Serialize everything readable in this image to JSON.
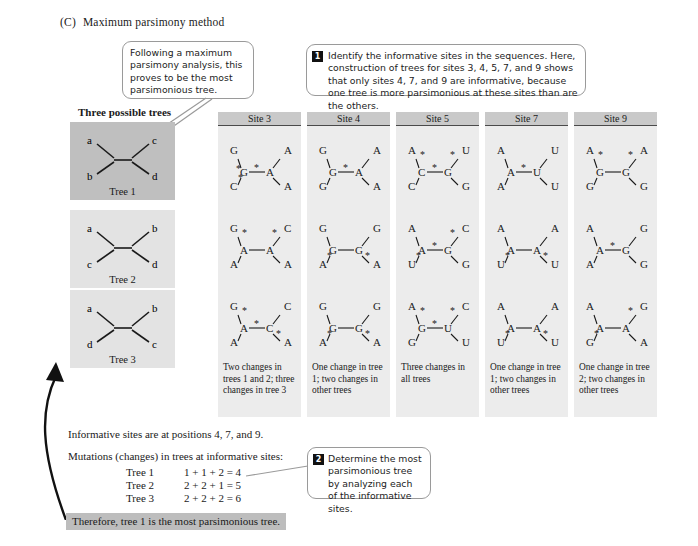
{
  "panel": {
    "label": "(C)",
    "title": "Maximum parsimony method"
  },
  "callouts": {
    "left": {
      "text": "Following a maximum parsimony analysis, this proves to be the most parsimonious tree."
    },
    "step1": {
      "number": "1",
      "text": "Identify the informative sites in the sequences. Here, construction of trees for sites 3, 4, 5, 7, and 9 shows that only sites 4, 7, and 9 are informative, because one tree is more parsimonious at these sites than are the others."
    },
    "step2": {
      "number": "2",
      "text": "Determine the most parsimonious tree by analyzing each of the informative sites."
    }
  },
  "trees_panel": {
    "heading": "Three possible trees",
    "trees": [
      {
        "label": "Tree 1",
        "tips": {
          "top_left": "a",
          "bottom_left": "b",
          "top_right": "c",
          "bottom_right": "d"
        },
        "highlighted": true
      },
      {
        "label": "Tree 2",
        "tips": {
          "top_left": "a",
          "bottom_left": "c",
          "top_right": "b",
          "bottom_right": "d"
        },
        "highlighted": false
      },
      {
        "label": "Tree 3",
        "tips": {
          "top_left": "a",
          "bottom_left": "d",
          "top_right": "b",
          "bottom_right": "c"
        },
        "highlighted": false
      }
    ]
  },
  "site_columns": [
    {
      "header": "Site 3",
      "caption": "Two changes in trees 1 and 2; three changes in tree 3",
      "trees": [
        {
          "top_left": "G",
          "bottom_left": "C",
          "top_right": "A",
          "bottom_right": "A",
          "internal_left": "G",
          "internal_right": "A",
          "asterisks": [
            "bottom-left",
            "internal-left",
            "middle"
          ]
        },
        {
          "top_left": "G",
          "bottom_left": "A",
          "top_right": "C",
          "bottom_right": "A",
          "internal_left": "A",
          "internal_right": "A",
          "asterisks": [
            "top-left",
            "top-right"
          ]
        },
        {
          "top_left": "G",
          "bottom_left": "A",
          "top_right": "C",
          "bottom_right": "A",
          "internal_left": "A",
          "internal_right": "C",
          "asterisks": [
            "top-left",
            "middle",
            "bottom-right"
          ]
        }
      ]
    },
    {
      "header": "Site 4",
      "caption": "One change in tree 1; two changes in other trees",
      "trees": [
        {
          "top_left": "G",
          "bottom_left": "G",
          "top_right": "A",
          "bottom_right": "A",
          "internal_left": "G",
          "internal_right": "A",
          "asterisks": [
            "middle"
          ]
        },
        {
          "top_left": "G",
          "bottom_left": "A",
          "top_right": "G",
          "bottom_right": "A",
          "internal_left": "G",
          "internal_right": "G",
          "asterisks": [
            "bottom-left",
            "bottom-right"
          ]
        },
        {
          "top_left": "G",
          "bottom_left": "A",
          "top_right": "G",
          "bottom_right": "A",
          "internal_left": "G",
          "internal_right": "G",
          "asterisks": [
            "bottom-left",
            "bottom-right"
          ]
        }
      ]
    },
    {
      "header": "Site 5",
      "caption": "Three changes in all trees",
      "trees": [
        {
          "top_left": "A",
          "bottom_left": "C",
          "top_right": "U",
          "bottom_right": "G",
          "internal_left": "C",
          "internal_right": "G",
          "asterisks": [
            "top-left",
            "middle",
            "top-right"
          ]
        },
        {
          "top_left": "A",
          "bottom_left": "U",
          "top_right": "C",
          "bottom_right": "G",
          "internal_left": "A",
          "internal_right": "G",
          "asterisks": [
            "bottom-left",
            "middle",
            "top-right"
          ]
        },
        {
          "top_left": "A",
          "bottom_left": "G",
          "top_right": "C",
          "bottom_right": "U",
          "internal_left": "G",
          "internal_right": "U",
          "asterisks": [
            "top-left",
            "middle",
            "top-right"
          ]
        }
      ]
    },
    {
      "header": "Site 7",
      "caption": "One change in tree 1; two changes in other trees",
      "trees": [
        {
          "top_left": "A",
          "bottom_left": "A",
          "top_right": "U",
          "bottom_right": "U",
          "internal_left": "A",
          "internal_right": "U",
          "asterisks": [
            "middle"
          ]
        },
        {
          "top_left": "A",
          "bottom_left": "U",
          "top_right": "A",
          "bottom_right": "U",
          "internal_left": "A",
          "internal_right": "A",
          "asterisks": [
            "bottom-left",
            "bottom-right"
          ]
        },
        {
          "top_left": "A",
          "bottom_left": "U",
          "top_right": "A",
          "bottom_right": "U",
          "internal_left": "A",
          "internal_right": "A",
          "asterisks": [
            "bottom-left",
            "bottom-right"
          ]
        }
      ]
    },
    {
      "header": "Site 9",
      "caption": "One change in tree 2; two changes in other trees",
      "trees": [
        {
          "top_left": "A",
          "bottom_left": "G",
          "top_right": "A",
          "bottom_right": "G",
          "internal_left": "G",
          "internal_right": "G",
          "asterisks": [
            "top-left",
            "top-right"
          ]
        },
        {
          "top_left": "A",
          "bottom_left": "A",
          "top_right": "G",
          "bottom_right": "G",
          "internal_left": "A",
          "internal_right": "G",
          "asterisks": [
            "middle"
          ]
        },
        {
          "top_left": "A",
          "bottom_left": "G",
          "top_right": "G",
          "bottom_right": "A",
          "internal_left": "A",
          "internal_right": "A",
          "asterisks": [
            "bottom-left",
            "top-right"
          ]
        }
      ]
    }
  ],
  "summary": {
    "informative_line": "Informative sites are at positions 4, 7, and 9.",
    "mutations_line": "Mutations (changes) in trees at informative sites:",
    "rows": [
      {
        "tree": "Tree 1",
        "calc": "1 + 1 + 2 = 4"
      },
      {
        "tree": "Tree 2",
        "calc": "2 + 2 + 1 = 5"
      },
      {
        "tree": "Tree 3",
        "calc": "2 + 2 + 2 = 6"
      }
    ],
    "conclusion": "Therefore, tree 1 is the most parsimonious tree."
  }
}
